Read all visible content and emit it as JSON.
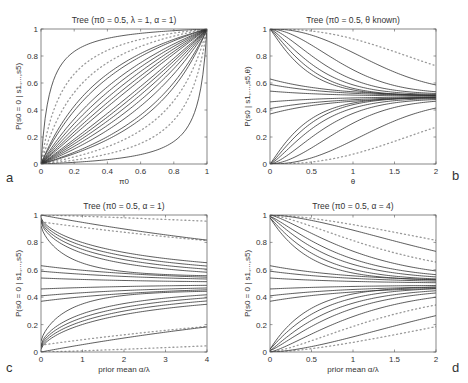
{
  "figure": {
    "panel_letters": [
      "a",
      "b",
      "c",
      "d"
    ]
  },
  "chart_data": [
    {
      "panel": "a",
      "type": "line",
      "title": "Tree (π0 = 0.5, λ = 1, α = 1)",
      "xlabel": "π0",
      "ylabel": "P(s0 = 0 | s1,...,s5)",
      "xlim": [
        0,
        1
      ],
      "ylim": [
        0,
        1
      ],
      "xticks": [
        0,
        0.2,
        0.4,
        0.6,
        0.8,
        1
      ],
      "xticklabels": [
        "0",
        "0.2",
        "0.4",
        "0.6",
        "0.8",
        "1"
      ],
      "yticks": [
        0,
        0.2,
        0.4,
        0.6,
        0.8,
        1
      ],
      "yticklabels": [
        "0",
        "0.2",
        "0.4",
        "0.6",
        "0.8",
        "1"
      ],
      "grid": false,
      "curve_family": "odds",
      "solid_odds_ratios": [
        0.05,
        0.33,
        0.38,
        0.5,
        0.6,
        0.7,
        0.8,
        0.9,
        1.1,
        1.25,
        1.45,
        1.7,
        2.0,
        2.6,
        3.0,
        20
      ],
      "dotted_odds_ratios": [
        0.12,
        0.22,
        4.5,
        8
      ]
    },
    {
      "panel": "b",
      "type": "line",
      "title": "Tree (π0 = 0.5, θ known)",
      "xlabel": "θ",
      "ylabel": "P(s0 | s1,...,s5,θ)",
      "xlim": [
        0,
        2
      ],
      "ylim": [
        0,
        1
      ],
      "xticks": [
        0,
        0.5,
        1,
        1.5,
        2
      ],
      "xticklabels": [
        "0",
        "0.5",
        "1",
        "1.5",
        "2"
      ],
      "yticks": [
        0,
        0.2,
        0.4,
        0.6,
        0.8,
        1
      ],
      "yticklabels": [
        "0",
        "0.2",
        "0.4",
        "0.6",
        "0.8",
        "1"
      ],
      "grid": false,
      "curve_family": "decay",
      "solid_curves": [
        {
          "y0": 1.0,
          "rate": 1.3,
          "shape": 2.2,
          "end": 0.53
        },
        {
          "y0": 1.0,
          "rate": 1.8,
          "shape": 1.8,
          "end": 0.52
        },
        {
          "y0": 1.0,
          "rate": 2.3,
          "shape": 1.5,
          "end": 0.515
        },
        {
          "y0": 1.0,
          "rate": 2.8,
          "shape": 1.3,
          "end": 0.51
        },
        {
          "y0": 1.0,
          "rate": 3.3,
          "shape": 1.2,
          "end": 0.505
        },
        {
          "y0": 1.0,
          "rate": 3.8,
          "shape": 1.1,
          "end": 0.505
        },
        {
          "y0": 0.63,
          "rate": 2.2,
          "shape": 1.0,
          "end": 0.5
        },
        {
          "y0": 0.59,
          "rate": 2.2,
          "shape": 1.0,
          "end": 0.5
        },
        {
          "y0": 0.54,
          "rate": 2.2,
          "shape": 1.0,
          "end": 0.5
        },
        {
          "y0": 0.46,
          "rate": 2.2,
          "shape": 1.0,
          "end": 0.5
        },
        {
          "y0": 0.41,
          "rate": 2.2,
          "shape": 1.0,
          "end": 0.5
        },
        {
          "y0": 0.37,
          "rate": 2.2,
          "shape": 1.0,
          "end": 0.5
        },
        {
          "y0": 0.0,
          "rate": 3.8,
          "shape": 1.1,
          "end": 0.495
        },
        {
          "y0": 0.0,
          "rate": 3.3,
          "shape": 1.2,
          "end": 0.495
        },
        {
          "y0": 0.0,
          "rate": 2.8,
          "shape": 1.3,
          "end": 0.49
        },
        {
          "y0": 0.0,
          "rate": 2.3,
          "shape": 1.5,
          "end": 0.485
        },
        {
          "y0": 0.0,
          "rate": 1.8,
          "shape": 1.8,
          "end": 0.48
        },
        {
          "y0": 0.0,
          "rate": 1.3,
          "shape": 2.2,
          "end": 0.47
        }
      ],
      "dotted_curves": [
        {
          "y0": 1.0,
          "rate": 0.9,
          "shape": 2.4,
          "end": 0.55
        },
        {
          "y0": 0.0,
          "rate": 0.9,
          "shape": 2.4,
          "end": 0.45
        }
      ]
    },
    {
      "panel": "c",
      "type": "line",
      "title": "Tree (π0 = 0.5, α = 1)",
      "xlabel": "prior mean α/λ",
      "ylabel": "P(s0 = 0 | s1,...,s5)",
      "xlim": [
        0,
        4
      ],
      "ylim": [
        0,
        1
      ],
      "xticks": [
        0,
        1,
        2,
        3,
        4
      ],
      "xticklabels": [
        "0",
        "1",
        "2",
        "3",
        "4"
      ],
      "yticks": [
        0,
        0.2,
        0.4,
        0.6,
        0.8,
        1
      ],
      "yticklabels": [
        "0",
        "0.2",
        "0.4",
        "0.6",
        "0.8",
        "1"
      ],
      "grid": false,
      "curve_family": "decay",
      "solid_curves": [
        {
          "y0": 1.0,
          "rate": 0.38,
          "shape": 1.0,
          "end": 0.5
        },
        {
          "y0": 0.98,
          "rate": 1.3,
          "shape": 0.7,
          "end": 0.55
        },
        {
          "y0": 0.97,
          "rate": 1.5,
          "shape": 0.7,
          "end": 0.54
        },
        {
          "y0": 0.96,
          "rate": 1.8,
          "shape": 0.7,
          "end": 0.535
        },
        {
          "y0": 0.95,
          "rate": 2.2,
          "shape": 0.7,
          "end": 0.53
        },
        {
          "y0": 0.92,
          "rate": 4.5,
          "shape": 0.8,
          "end": 0.55
        },
        {
          "y0": 0.63,
          "rate": 1.2,
          "shape": 1.0,
          "end": 0.52
        },
        {
          "y0": 0.59,
          "rate": 1.2,
          "shape": 1.0,
          "end": 0.515
        },
        {
          "y0": 0.54,
          "rate": 1.2,
          "shape": 1.0,
          "end": 0.505
        },
        {
          "y0": 0.46,
          "rate": 1.2,
          "shape": 1.0,
          "end": 0.495
        },
        {
          "y0": 0.41,
          "rate": 1.2,
          "shape": 1.0,
          "end": 0.485
        },
        {
          "y0": 0.37,
          "rate": 1.2,
          "shape": 1.0,
          "end": 0.48
        },
        {
          "y0": 0.08,
          "rate": 4.5,
          "shape": 0.8,
          "end": 0.45
        },
        {
          "y0": 0.05,
          "rate": 2.2,
          "shape": 0.7,
          "end": 0.47
        },
        {
          "y0": 0.04,
          "rate": 1.8,
          "shape": 0.7,
          "end": 0.465
        },
        {
          "y0": 0.03,
          "rate": 1.5,
          "shape": 0.7,
          "end": 0.46
        },
        {
          "y0": 0.02,
          "rate": 1.3,
          "shape": 0.7,
          "end": 0.45
        },
        {
          "y0": 0.0,
          "rate": 0.38,
          "shape": 1.0,
          "end": 0.5
        }
      ],
      "dotted_curves": [
        {
          "y0": 1.0,
          "rate": 0.12,
          "shape": 1.2,
          "end": 0.5
        },
        {
          "y0": 0.95,
          "rate": 0.35,
          "shape": 1.0,
          "end": 0.55
        },
        {
          "y0": 0.05,
          "rate": 0.35,
          "shape": 1.0,
          "end": 0.45
        },
        {
          "y0": 0.0,
          "rate": 0.12,
          "shape": 1.2,
          "end": 0.5
        }
      ]
    },
    {
      "panel": "d",
      "type": "line",
      "title": "Tree (π0 = 0.5, α = 4)",
      "xlabel": "prior mean α/λ",
      "ylabel": "P(s0 = 0 | s1,...,s5)",
      "xlim": [
        0,
        2
      ],
      "ylim": [
        0,
        1
      ],
      "xticks": [
        0,
        0.5,
        1,
        1.5,
        2
      ],
      "xticklabels": [
        "0",
        "0.5",
        "1",
        "1.5",
        "2"
      ],
      "yticks": [
        0,
        0.2,
        0.4,
        0.6,
        0.8,
        1
      ],
      "yticklabels": [
        "0",
        "0.2",
        "0.4",
        "0.6",
        "0.8",
        "1"
      ],
      "grid": false,
      "curve_family": "decay",
      "solid_curves": [
        {
          "y0": 1.0,
          "rate": 0.75,
          "shape": 1.6,
          "end": 0.5
        },
        {
          "y0": 1.0,
          "rate": 1.5,
          "shape": 1.3,
          "end": 0.53
        },
        {
          "y0": 0.99,
          "rate": 1.9,
          "shape": 1.2,
          "end": 0.53
        },
        {
          "y0": 0.99,
          "rate": 2.3,
          "shape": 1.1,
          "end": 0.525
        },
        {
          "y0": 0.98,
          "rate": 2.8,
          "shape": 1.05,
          "end": 0.52
        },
        {
          "y0": 0.98,
          "rate": 3.5,
          "shape": 1.0,
          "end": 0.52
        },
        {
          "y0": 0.63,
          "rate": 1.6,
          "shape": 1.0,
          "end": 0.51
        },
        {
          "y0": 0.59,
          "rate": 1.6,
          "shape": 1.0,
          "end": 0.505
        },
        {
          "y0": 0.54,
          "rate": 1.6,
          "shape": 1.0,
          "end": 0.5
        },
        {
          "y0": 0.46,
          "rate": 1.6,
          "shape": 1.0,
          "end": 0.49
        },
        {
          "y0": 0.41,
          "rate": 1.6,
          "shape": 1.0,
          "end": 0.485
        },
        {
          "y0": 0.37,
          "rate": 1.6,
          "shape": 1.0,
          "end": 0.48
        },
        {
          "y0": 0.02,
          "rate": 3.5,
          "shape": 1.0,
          "end": 0.48
        },
        {
          "y0": 0.02,
          "rate": 2.8,
          "shape": 1.05,
          "end": 0.475
        },
        {
          "y0": 0.01,
          "rate": 2.3,
          "shape": 1.1,
          "end": 0.47
        },
        {
          "y0": 0.01,
          "rate": 1.9,
          "shape": 1.2,
          "end": 0.465
        },
        {
          "y0": 0.0,
          "rate": 1.5,
          "shape": 1.3,
          "end": 0.46
        },
        {
          "y0": 0.0,
          "rate": 0.75,
          "shape": 1.6,
          "end": 0.5
        }
      ],
      "dotted_curves": [
        {
          "y0": 1.0,
          "rate": 0.55,
          "shape": 1.6,
          "end": 0.5
        },
        {
          "y0": 1.0,
          "rate": 1.1,
          "shape": 1.4,
          "end": 0.54
        },
        {
          "y0": 0.0,
          "rate": 1.1,
          "shape": 1.4,
          "end": 0.46
        },
        {
          "y0": 0.0,
          "rate": 0.55,
          "shape": 1.6,
          "end": 0.5
        }
      ]
    }
  ]
}
